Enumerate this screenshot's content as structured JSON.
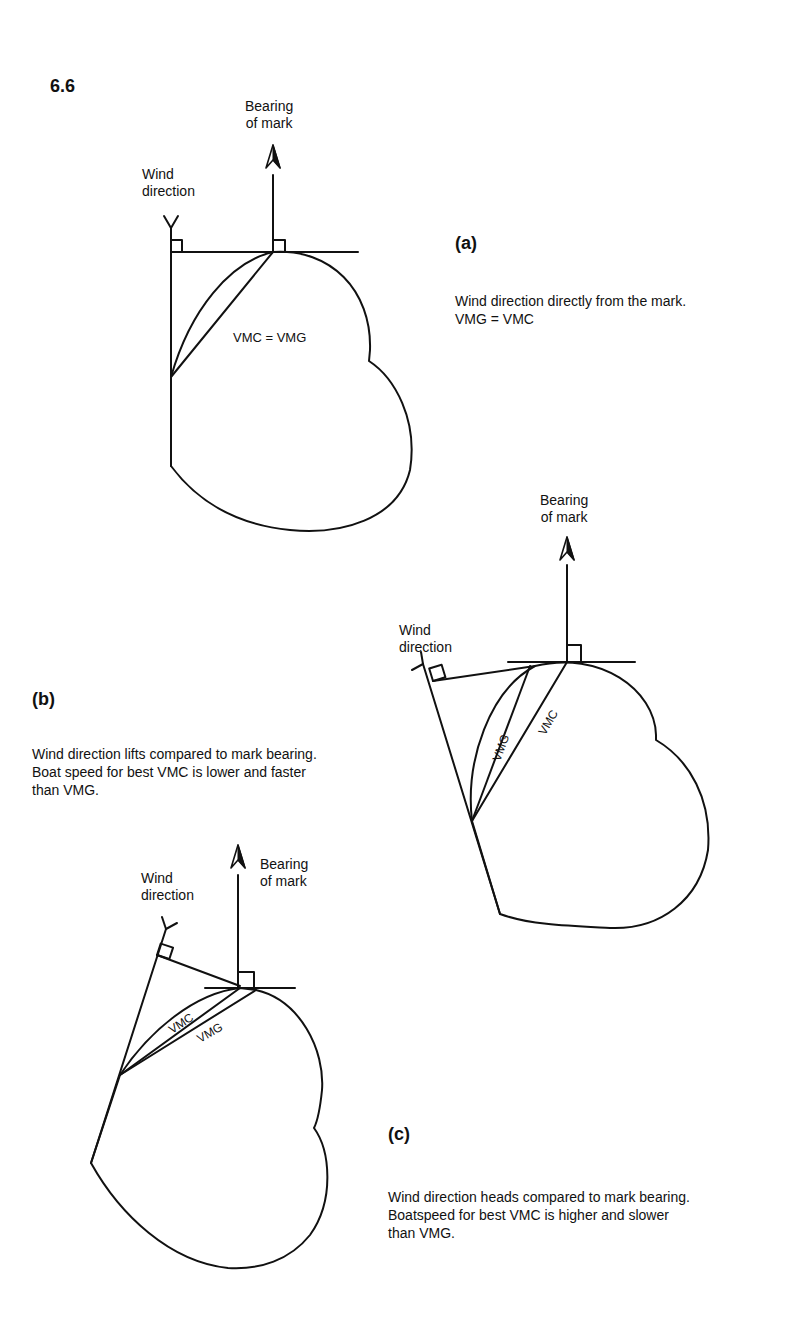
{
  "figure": {
    "number": "6.6"
  },
  "panels": {
    "a": {
      "label": "(a)",
      "caption": "Wind direction directly from the mark.\nVMG = VMC",
      "wind_label": "Wind\ndirection",
      "bearing_label": "Bearing\nof mark",
      "inner_label": "VMC = VMG"
    },
    "b": {
      "label": "(b)",
      "caption": "Wind direction lifts compared to mark bearing.\nBoat speed for best VMC is lower and faster\nthan VMG.",
      "wind_label": "Wind\ndirection",
      "bearing_label": "Bearing\nof mark",
      "vmg_label": "VMG",
      "vmc_label": "VMC"
    },
    "c": {
      "label": "(c)",
      "caption": "Wind direction heads compared to mark bearing.\nBoatspeed for best VMC is higher and slower\nthan VMG.",
      "wind_label": "Wind\ndirection",
      "bearing_label": "Bearing\nof mark",
      "vmc_label": "VMC",
      "vmg_label": "VMG"
    }
  },
  "icons": {
    "wind_arrow": "wind-feather-icon",
    "bearing_arrow": "north-arrow-icon",
    "right_angle": "right-angle-marker"
  },
  "colors": {
    "ink": "#111111",
    "background": "#ffffff"
  }
}
